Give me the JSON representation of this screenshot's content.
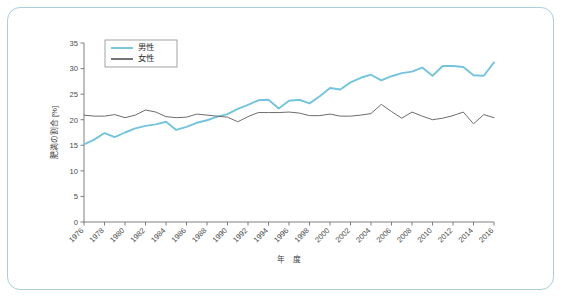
{
  "frame": {
    "border_color": "#a8cfdb",
    "background": "#ffffff"
  },
  "chart_data": {
    "type": "line",
    "title": "",
    "xlabel": "年　度",
    "ylabel": "肥満の割合 [%]",
    "ylim": [
      0,
      35
    ],
    "xlim": [
      1976,
      2016
    ],
    "yticks": [
      0,
      5,
      10,
      15,
      20,
      25,
      30,
      35
    ],
    "ytick_labels": [
      "0",
      "5",
      "10",
      "15",
      "20",
      "25",
      "30",
      "35"
    ],
    "xticks": [
      1976,
      1978,
      1980,
      1982,
      1984,
      1986,
      1988,
      1990,
      1992,
      1994,
      1996,
      1998,
      2000,
      2002,
      2004,
      2006,
      2008,
      2010,
      2012,
      2014,
      2016
    ],
    "xtick_labels": [
      "1976",
      "1978",
      "1980",
      "1982",
      "1984",
      "1986",
      "1988",
      "1990",
      "1992",
      "1994",
      "1996",
      "1998",
      "2000",
      "2002",
      "2004",
      "2006",
      "2008",
      "2010",
      "2012",
      "2014",
      "2016"
    ],
    "grid": false,
    "legend_position": "upper-left",
    "x": [
      1976,
      1977,
      1978,
      1979,
      1980,
      1981,
      1982,
      1983,
      1984,
      1985,
      1986,
      1987,
      1988,
      1989,
      1990,
      1991,
      1992,
      1993,
      1994,
      1995,
      1996,
      1997,
      1998,
      1999,
      2000,
      2001,
      2002,
      2003,
      2004,
      2005,
      2006,
      2007,
      2008,
      2009,
      2010,
      2011,
      2012,
      2013,
      2014,
      2015,
      2016
    ],
    "series": [
      {
        "name": "男性",
        "color": "#74c4dc",
        "linewidth": 1.9,
        "values": [
          15.2,
          16.1,
          17.4,
          16.6,
          17.5,
          18.3,
          18.8,
          19.1,
          19.6,
          18.0,
          18.6,
          19.4,
          19.9,
          20.6,
          21.1,
          22.1,
          22.9,
          23.8,
          23.9,
          22.2,
          23.7,
          23.9,
          23.2,
          24.6,
          26.2,
          25.9,
          27.3,
          28.2,
          28.8,
          27.7,
          28.5,
          29.1,
          29.4,
          30.2,
          28.6,
          30.5,
          30.5,
          30.3,
          28.7,
          28.6,
          31.2
        ]
      },
      {
        "name": "女性",
        "color": "#6d6d6d",
        "linewidth": 1.0,
        "values": [
          20.9,
          20.7,
          20.7,
          21.0,
          20.4,
          20.9,
          21.9,
          21.5,
          20.6,
          20.4,
          20.5,
          21.1,
          20.9,
          20.7,
          20.5,
          19.6,
          20.6,
          21.4,
          21.4,
          21.4,
          21.5,
          21.3,
          20.8,
          20.8,
          21.1,
          20.7,
          20.7,
          20.9,
          21.2,
          23.0,
          21.6,
          20.3,
          21.5,
          20.7,
          20.0,
          20.3,
          20.8,
          21.5,
          19.2,
          21.0,
          20.4
        ]
      }
    ]
  }
}
